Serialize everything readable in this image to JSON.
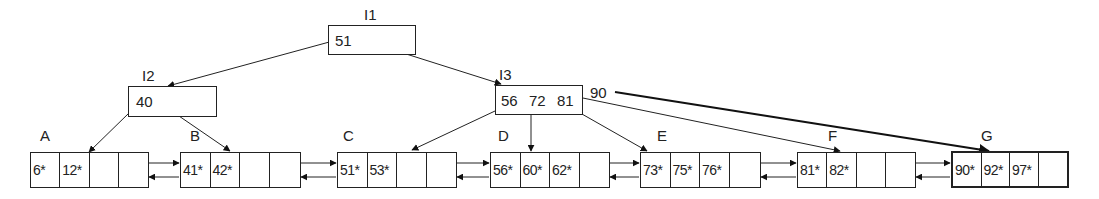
{
  "diagram": {
    "type": "B+ tree",
    "internal_nodes": [
      {
        "id": "I1",
        "label": "I1",
        "keys": [
          "51"
        ]
      },
      {
        "id": "I2",
        "label": "I2",
        "keys": [
          "40"
        ]
      },
      {
        "id": "I3",
        "label": "I3",
        "keys": [
          "56",
          "72",
          "81"
        ],
        "overflow_key": "90"
      }
    ],
    "leaf_nodes": [
      {
        "id": "A",
        "label": "A",
        "entries": [
          "6*",
          "12*",
          "",
          ""
        ]
      },
      {
        "id": "B",
        "label": "B",
        "entries": [
          "41*",
          "42*",
          "",
          ""
        ]
      },
      {
        "id": "C",
        "label": "C",
        "entries": [
          "51*",
          "53*",
          "",
          ""
        ]
      },
      {
        "id": "D",
        "label": "D",
        "entries": [
          "56*",
          "60*",
          "62*",
          ""
        ]
      },
      {
        "id": "E",
        "label": "E",
        "entries": [
          "73*",
          "75*",
          "76*",
          ""
        ]
      },
      {
        "id": "F",
        "label": "F",
        "entries": [
          "81*",
          "82*",
          "",
          ""
        ]
      },
      {
        "id": "G",
        "label": "G",
        "entries": [
          "90*",
          "92*",
          "97*",
          ""
        ],
        "highlighted": true
      }
    ],
    "edges": [
      {
        "from": "I1",
        "to": "I2"
      },
      {
        "from": "I1",
        "to": "I3"
      },
      {
        "from": "I2",
        "to": "A"
      },
      {
        "from": "I2",
        "to": "B"
      },
      {
        "from": "I3",
        "to": "C"
      },
      {
        "from": "I3",
        "to": "D"
      },
      {
        "from": "I3",
        "to": "E"
      },
      {
        "from": "I3",
        "to": "F"
      },
      {
        "from": "I3",
        "to": "G",
        "via_key": "90",
        "emphasized": true
      }
    ],
    "sibling_links": "doubly-linked leaves A<->B<->C<->D<->E<->F<->G"
  }
}
